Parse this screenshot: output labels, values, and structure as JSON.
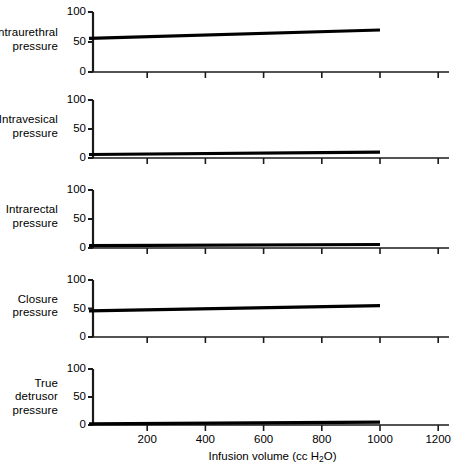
{
  "figure": {
    "background": "#ffffff",
    "ink": "#000000",
    "axis_color": "#1a1a1a",
    "data_color": "#000000"
  },
  "xaxis": {
    "title_main": "Infusion volume (cc H",
    "title_sub": "2",
    "title_tail": "O)",
    "title_full": "Infusion volume (cc H2O)",
    "ticks": [
      0,
      200,
      400,
      600,
      800,
      1000,
      1200
    ],
    "tick_labels": [
      "",
      "200",
      "400",
      "600",
      "800",
      "1000",
      "1200"
    ],
    "min": 0,
    "max": 1250
  },
  "yaxis": {
    "ticks": [
      0,
      50,
      100
    ],
    "tick_labels": [
      "0",
      "50",
      "100"
    ],
    "min": 0,
    "max": 100
  },
  "chart_data": {
    "type": "line",
    "title": "",
    "xlabel": "Infusion volume (cc H2O)",
    "ylabel": "",
    "xlim": [
      0,
      1250
    ],
    "ylim": [
      0,
      100
    ],
    "grid": false,
    "legend": "none",
    "xticks": [
      0,
      200,
      400,
      600,
      800,
      1000,
      1200
    ],
    "yticks": [
      0,
      50,
      100
    ],
    "panels": [
      {
        "label_lines": [
          "Intraurethral",
          "pressure"
        ],
        "label_text": "Intraurethral pressure",
        "x": [
          0,
          1000
        ],
        "y": [
          56,
          70
        ],
        "series_name": "Intraurethral pressure"
      },
      {
        "label_lines": [
          "Intravesical",
          "pressure"
        ],
        "label_text": "Intravesical pressure",
        "x": [
          0,
          1000
        ],
        "y": [
          6,
          10
        ],
        "series_name": "Intravesical pressure"
      },
      {
        "label_lines": [
          "Intrarectal",
          "pressure"
        ],
        "label_text": "Intrarectal pressure",
        "x": [
          0,
          1000
        ],
        "y": [
          4,
          6
        ],
        "series_name": "Intrarectal pressure"
      },
      {
        "label_lines": [
          "Closure",
          "pressure"
        ],
        "label_text": "Closure pressure",
        "x": [
          0,
          1000
        ],
        "y": [
          46,
          55
        ],
        "series_name": "Closure pressure"
      },
      {
        "label_lines": [
          "True",
          "detrusor",
          "pressure"
        ],
        "label_text": "True detrusor pressure",
        "x": [
          0,
          1000
        ],
        "y": [
          2,
          5
        ],
        "series_name": "True detrusor pressure"
      }
    ]
  }
}
